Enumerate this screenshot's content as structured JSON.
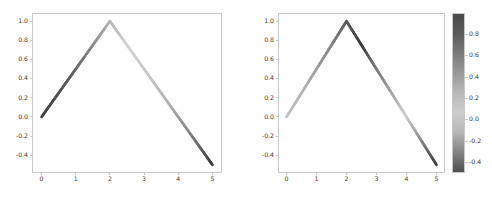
{
  "figure": {
    "width": 492,
    "height": 197,
    "background": "#ffffff",
    "axis_color": "#c8c8c8",
    "tick_text_color": "#3b3b3b",
    "colormap": "gray"
  },
  "chart_data": [
    {
      "type": "line",
      "panel": "left",
      "title": "",
      "xlabel": "",
      "ylabel": "",
      "x": [
        0,
        2,
        5
      ],
      "y": [
        0.0,
        1.0,
        -0.5
      ],
      "xticks": [
        "0",
        "1",
        "2",
        "3",
        "4",
        "5"
      ],
      "xtick_values": [
        0,
        1,
        2,
        3,
        4,
        5
      ],
      "yticks": [
        "1.0",
        "0.8",
        "0.6",
        "0.4",
        "0.2",
        "0.0",
        "-0.2",
        "-0.4"
      ],
      "ytick_values": [
        1.0,
        0.8,
        0.6,
        0.4,
        0.2,
        0.0,
        -0.2,
        -0.4
      ],
      "xlim": [
        -0.25,
        5.25
      ],
      "ylim": [
        -0.575,
        1.075
      ],
      "grid": false,
      "legend": null,
      "colorbar": false,
      "line_colorstops": [
        {
          "t": 0.0,
          "color": "#3f3f3f"
        },
        {
          "t": 0.18,
          "color": "#606060"
        },
        {
          "t": 0.34,
          "color": "#9a9a9a"
        },
        {
          "t": 0.42,
          "color": "#bdbdbd"
        },
        {
          "t": 0.5,
          "color": "#d2d2d2"
        },
        {
          "t": 0.62,
          "color": "#c9c9c9"
        },
        {
          "t": 0.74,
          "color": "#b4b4b4"
        },
        {
          "t": 0.86,
          "color": "#8c8c8c"
        },
        {
          "t": 1.0,
          "color": "#3a3a3a"
        }
      ]
    },
    {
      "type": "line",
      "panel": "right",
      "title": "",
      "xlabel": "",
      "ylabel": "",
      "x": [
        0,
        2,
        5
      ],
      "y": [
        0.0,
        1.0,
        -0.5
      ],
      "xticks": [
        "0",
        "1",
        "2",
        "3",
        "4",
        "5"
      ],
      "xtick_values": [
        0,
        1,
        2,
        3,
        4,
        5
      ],
      "yticks": [
        "1.0",
        "0.8",
        "0.6",
        "0.4",
        "0.2",
        "0.0",
        "-0.2",
        "-0.4"
      ],
      "ytick_values": [
        1.0,
        0.8,
        0.6,
        0.4,
        0.2,
        0.0,
        -0.2,
        -0.4
      ],
      "xlim": [
        -0.25,
        5.25
      ],
      "ylim": [
        -0.575,
        1.075
      ],
      "grid": false,
      "legend": null,
      "colorbar": true,
      "line_colorstops": [
        {
          "t": 0.0,
          "color": "#c5c5c5"
        },
        {
          "t": 0.14,
          "color": "#b0b0b0"
        },
        {
          "t": 0.28,
          "color": "#8d8d8d"
        },
        {
          "t": 0.4,
          "color": "#5d5d5d"
        },
        {
          "t": 0.5,
          "color": "#3a3a3a"
        },
        {
          "t": 0.58,
          "color": "#6f6f6f"
        },
        {
          "t": 0.7,
          "color": "#a5a5a5"
        },
        {
          "t": 0.8,
          "color": "#cfcfcf"
        },
        {
          "t": 0.9,
          "color": "#8a8a8a"
        },
        {
          "t": 1.0,
          "color": "#3d3d3d"
        }
      ],
      "colorbar_data": {
        "orientation": "vertical",
        "vmin": -0.5,
        "vmax": 1.0,
        "ticks": [
          "0.8",
          "0.6",
          "0.4",
          "0.2",
          "0.0",
          "-0.2",
          "-0.4"
        ],
        "tick_values": [
          0.8,
          0.6,
          0.4,
          0.2,
          0.0,
          -0.2,
          -0.4
        ],
        "gradient_stops": [
          {
            "t": 0.0,
            "color": "#4a4a4a"
          },
          {
            "t": 0.12,
            "color": "#5a5a5a"
          },
          {
            "t": 0.3,
            "color": "#868686"
          },
          {
            "t": 0.48,
            "color": "#b4b4b4"
          },
          {
            "t": 0.62,
            "color": "#cdcdcd"
          },
          {
            "t": 0.74,
            "color": "#b9b9b9"
          },
          {
            "t": 0.86,
            "color": "#8a8a8a"
          },
          {
            "t": 1.0,
            "color": "#4f4f4f"
          }
        ]
      }
    }
  ]
}
